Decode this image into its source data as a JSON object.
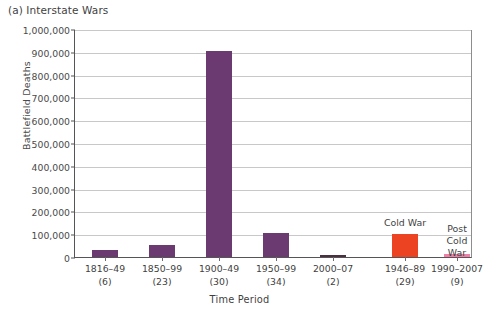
{
  "figure": {
    "title": "(a) Interstate Wars"
  },
  "chart_data": {
    "type": "bar",
    "title": "(a) Interstate Wars",
    "xlabel": "Time Period",
    "ylabel": "Battlefield Deaths",
    "ylim": [
      0,
      1000000
    ],
    "ytick_labels": [
      "1,000,000",
      "900,000",
      "800,000",
      "700,000",
      "600,000",
      "500,000",
      "400,000",
      "300,000",
      "200,000",
      "100,000",
      "0"
    ],
    "ytick_values": [
      1000000,
      900000,
      800000,
      700000,
      600000,
      500000,
      400000,
      300000,
      200000,
      100000,
      0
    ],
    "grid": true,
    "legend_position": "none",
    "categories": [
      "1816–49",
      "1850–99",
      "1900–49",
      "1950–99",
      "2000–07",
      "1946–89",
      "1990–2007"
    ],
    "category_counts": [
      "(6)",
      "(23)",
      "(30)",
      "(34)",
      "(2)",
      "(29)",
      "(9)"
    ],
    "values": [
      30000,
      52000,
      905000,
      105000,
      9000,
      100000,
      12000
    ],
    "bar_colors": [
      "#6b3a70",
      "#6b3a70",
      "#6b3a70",
      "#6b3a70",
      "#4a3040",
      "#ec4323",
      "#f07fa8"
    ],
    "annotations": [
      {
        "text": "Cold War",
        "category": "1946–89"
      },
      {
        "text": "Post\nCold War",
        "category": "1990–2007"
      }
    ]
  },
  "colors": {
    "purple": "#6b3a70",
    "dark": "#4a3040",
    "red": "#ec4323",
    "pink": "#f07fa8",
    "gridline": "#c8c8c8",
    "axis": "#555555",
    "text": "#3f3f3f"
  }
}
